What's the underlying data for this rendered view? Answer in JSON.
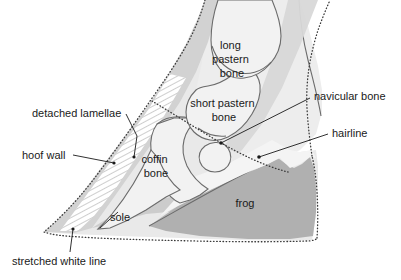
{
  "figure": {
    "background_color": "#ffffff",
    "line_color": "#6b6b6b",
    "dotted_color": "#3a3a3a",
    "text_color": "#1a1a1a"
  },
  "colors": {
    "hoof_wall_fill": "#d2d2d2",
    "hoof_inner_fill": "#e9e9e9",
    "bone_fill": "#f2f2f2",
    "leg_fill": "#ededed",
    "tendon_fill": "#d8d8d8",
    "frog_fill": "#b0b0b0",
    "sole_fill": "#c9c9c9",
    "white_line_fill": "#ffffff"
  },
  "labels": [
    {
      "id": "detached-lamellae",
      "text": "detached lamellae",
      "x": 32,
      "y": 117,
      "anchor": "start"
    },
    {
      "id": "hoof-wall",
      "text": "hoof wall",
      "x": 22,
      "y": 159,
      "anchor": "start"
    },
    {
      "id": "stretched-white-line",
      "text": "stretched white line",
      "x": 12,
      "y": 265,
      "anchor": "start"
    },
    {
      "id": "sole",
      "text": "sole",
      "x": 110,
      "y": 221,
      "anchor": "start"
    },
    {
      "id": "coffin-bone",
      "line1": "coffin",
      "line2": "bone",
      "x": 156,
      "y": 163,
      "anchor": "middle"
    },
    {
      "id": "short-pastern-bone",
      "line1": "short pastern",
      "line2": "bone",
      "x": 224,
      "y": 107,
      "anchor": "middle"
    },
    {
      "id": "long-pastern-bone",
      "line1": "long",
      "line2": "pastern",
      "line3": "bone",
      "x": 232,
      "y": 49,
      "anchor": "middle"
    },
    {
      "id": "navicular-bone",
      "text": "navicular bone",
      "x": 314,
      "y": 100,
      "anchor": "start"
    },
    {
      "id": "hairline",
      "text": "hairline",
      "x": 332,
      "y": 137,
      "anchor": "start"
    },
    {
      "id": "frog",
      "text": "frog",
      "x": 245,
      "y": 207,
      "anchor": "middle"
    }
  ],
  "leaders": [
    {
      "id": "leader-detached-lamellae",
      "path": "M 126 114 L 136 135"
    },
    {
      "id": "leader-hoof-wall",
      "path": "M 73 155 L 114 163",
      "dot": [
        114,
        163
      ]
    },
    {
      "id": "leader-stretched-white-line",
      "path": "M 70 254 L 73 229",
      "dot": [
        73,
        229
      ]
    },
    {
      "id": "leader-navicular-bone",
      "path": "M 310 99 L 221 143",
      "dot": [
        221,
        143
      ]
    },
    {
      "id": "leader-hairline",
      "path": "M 328 134 L 259 157",
      "dot": [
        259,
        157
      ]
    },
    {
      "id": "leader-lamellae-dot",
      "path": "",
      "dot": [
        134,
        157
      ]
    }
  ]
}
